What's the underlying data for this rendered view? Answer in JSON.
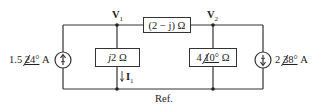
{
  "diagram": {
    "type": "circuit",
    "nodes": {
      "v1": {
        "label": "V",
        "sub": "1"
      },
      "v2": {
        "label": "V",
        "sub": "2"
      },
      "ref": {
        "label": "Ref."
      }
    },
    "sources": {
      "left": {
        "magnitude": "1.5",
        "angle": "24°",
        "unit": "A",
        "direction": "up"
      },
      "right": {
        "magnitude": "2",
        "angle": "38°",
        "unit": "A",
        "direction": "down"
      }
    },
    "impedances": {
      "series": {
        "label": "(2 − j) Ω"
      },
      "shunt_left": {
        "prefix": "j",
        "label": "2 Ω"
      },
      "shunt_right": {
        "magnitude": "4",
        "angle": "10°",
        "unit": "Ω"
      }
    },
    "current": {
      "label": "I",
      "sub": "1"
    },
    "colors": {
      "wire": "#333333",
      "text": "#222222",
      "background": "#ffffff"
    }
  }
}
